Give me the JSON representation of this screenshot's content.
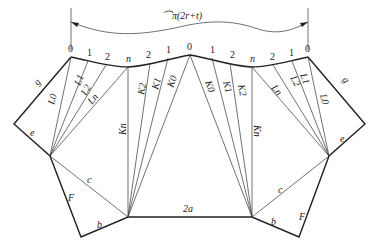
{
  "diagram": {
    "dimension_label": "⌒π(2r+t)",
    "point_labels_top": [
      "0",
      "1",
      "2",
      "n",
      "2",
      "1",
      "0",
      "1",
      "2",
      "n",
      "2",
      "1",
      "0"
    ],
    "left_fan_lines": [
      "L0",
      "L1",
      "L2",
      "Ln"
    ],
    "center_left_lines": [
      "Kn",
      "K2",
      "K1",
      "K0"
    ],
    "center_right_lines": [
      "K0",
      "K1",
      "K2",
      "Kn"
    ],
    "right_fan_lines": [
      "Ln",
      "L2",
      "L1",
      "L0"
    ],
    "edge_labels": {
      "g_left": "g",
      "e_left": "e",
      "c_left": "c",
      "F_left": "F",
      "b_left": "b",
      "bottom": "2a",
      "g_right": "g",
      "e_right": "e",
      "c_right": "c",
      "F_right": "F",
      "b_right": "b"
    }
  }
}
